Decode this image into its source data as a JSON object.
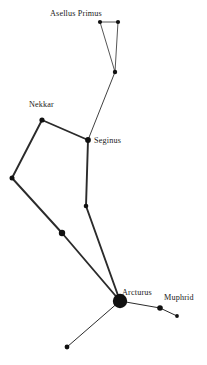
{
  "chart_data": {
    "type": "scatter",
    "xlabel": "",
    "ylabel": "",
    "xlim": [
      0,
      207
    ],
    "ylim": [
      0,
      365
    ],
    "grid": false,
    "legend": "none",
    "background_color": "#ffffff",
    "star_color": "#111111",
    "line_color": "#2b2b2b",
    "label_color": "#1a1a1a",
    "stars": [
      {
        "id": "s1",
        "name": "Asellus Primus",
        "x": 100,
        "y": 22,
        "radius": 2.1,
        "magnitude_rank": 5
      },
      {
        "id": "s2",
        "name": "",
        "x": 118,
        "y": 22,
        "radius": 2.1,
        "magnitude_rank": 5
      },
      {
        "id": "s3",
        "name": "",
        "x": 115,
        "y": 72,
        "radius": 2.2,
        "magnitude_rank": 5
      },
      {
        "id": "s4",
        "name": "Nekkar",
        "x": 42,
        "y": 120,
        "radius": 2.6,
        "magnitude_rank": 4
      },
      {
        "id": "s5",
        "name": "Seginus",
        "x": 88,
        "y": 140,
        "radius": 2.9,
        "magnitude_rank": 3
      },
      {
        "id": "s6",
        "name": "",
        "x": 12,
        "y": 178,
        "radius": 2.5,
        "magnitude_rank": 4
      },
      {
        "id": "s7",
        "name": "",
        "x": 86,
        "y": 206,
        "radius": 2.3,
        "magnitude_rank": 5
      },
      {
        "id": "s8",
        "name": "",
        "x": 62,
        "y": 233,
        "radius": 3.2,
        "magnitude_rank": 3
      },
      {
        "id": "s9",
        "name": "Arcturus",
        "x": 120,
        "y": 301,
        "radius": 7.2,
        "magnitude_rank": 1
      },
      {
        "id": "s10",
        "name": "Muphrid",
        "x": 160,
        "y": 308,
        "radius": 2.8,
        "magnitude_rank": 3
      },
      {
        "id": "s11",
        "name": "",
        "x": 177,
        "y": 316,
        "radius": 1.9,
        "magnitude_rank": 6
      },
      {
        "id": "s12",
        "name": "",
        "x": 67,
        "y": 347,
        "radius": 2.4,
        "magnitude_rank": 4
      }
    ],
    "lines": [
      {
        "from": "s1",
        "to": "s2",
        "width": 0.8
      },
      {
        "from": "s1",
        "to": "s3",
        "width": 0.8
      },
      {
        "from": "s2",
        "to": "s3",
        "width": 0.8
      },
      {
        "from": "s3",
        "to": "s5",
        "width": 0.9
      },
      {
        "from": "s4",
        "to": "s5",
        "width": 1.9
      },
      {
        "from": "s4",
        "to": "s6",
        "width": 1.9
      },
      {
        "from": "s5",
        "to": "s7",
        "width": 1.9
      },
      {
        "from": "s6",
        "to": "s8",
        "width": 1.9
      },
      {
        "from": "s7",
        "to": "s9",
        "width": 1.9
      },
      {
        "from": "s8",
        "to": "s9",
        "width": 1.9
      },
      {
        "from": "s9",
        "to": "s10",
        "width": 1.0
      },
      {
        "from": "s10",
        "to": "s11",
        "width": 1.0
      },
      {
        "from": "s9",
        "to": "s12",
        "width": 1.0
      }
    ],
    "labels": [
      {
        "text": "Asellus Primus",
        "x": 50,
        "y": 16,
        "anchor": "start",
        "for": "s1"
      },
      {
        "text": "Nekkar",
        "x": 29,
        "y": 107,
        "anchor": "start",
        "for": "s4"
      },
      {
        "text": "Seginus",
        "x": 94,
        "y": 143,
        "anchor": "start",
        "for": "s5"
      },
      {
        "text": "Arcturus",
        "x": 122,
        "y": 295,
        "anchor": "start",
        "for": "s9"
      },
      {
        "text": "Muphrid",
        "x": 164,
        "y": 300,
        "anchor": "start",
        "for": "s10"
      }
    ]
  }
}
